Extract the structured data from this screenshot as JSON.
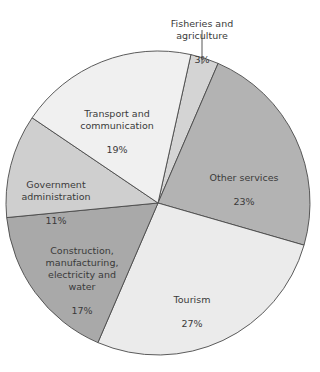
{
  "chart_data": {
    "type": "pie",
    "title": "",
    "start_angle_deg": 12.5,
    "direction": "clockwise",
    "slices": [
      {
        "label": "Fisheries and agriculture",
        "value": 3,
        "color": "#d4d4d4"
      },
      {
        "label": "Other services",
        "value": 23,
        "color": "#b3b3b3"
      },
      {
        "label": "Tourism",
        "value": 27,
        "color": "#ebebeb"
      },
      {
        "label": "Construction, manufacturing, electricity and water",
        "value": 17,
        "color": "#a9a9a9"
      },
      {
        "label": "Government administration",
        "value": 11,
        "color": "#cfcfcf"
      },
      {
        "label": "Transport and communication",
        "value": 19,
        "color": "#f0f0f0"
      }
    ],
    "units": "%"
  },
  "labels": {
    "fisheries": {
      "text": "Fisheries and agriculture",
      "pct": "3%"
    },
    "other": {
      "text": "Other services",
      "pct": "23%"
    },
    "tourism": {
      "text": "Tourism",
      "pct": "27%"
    },
    "construction": {
      "text": "Construction,\nmanufacturing,\nelectricity and\nwater",
      "pct": "17%"
    },
    "government": {
      "text": "Government\nadministration",
      "pct": "11%"
    },
    "transport": {
      "text": "Transport and\ncommunication",
      "pct": "19%"
    }
  }
}
